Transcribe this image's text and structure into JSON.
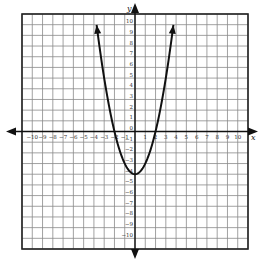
{
  "chart_data": {
    "type": "line",
    "title": "",
    "xlabel": "x",
    "ylabel": "y",
    "xlim": [
      -11,
      11
    ],
    "ylim": [
      -11,
      11
    ],
    "grid": true,
    "x_ticks": [
      -10,
      -9,
      -8,
      -7,
      -6,
      -5,
      -4,
      -3,
      -2,
      -1,
      1,
      2,
      3,
      4,
      5,
      6,
      7,
      8,
      9,
      10
    ],
    "y_ticks": [
      10,
      9,
      8,
      7,
      6,
      5,
      4,
      3,
      2,
      1,
      0,
      -1,
      -2,
      -3,
      -4,
      -5,
      -6,
      -7,
      -8,
      -9,
      -10
    ],
    "series": [
      {
        "name": "y = x^2 - 4",
        "equation": "y = x^2 - 4",
        "vertex": [
          0,
          -4
        ],
        "x_intercepts": [
          -2,
          2
        ],
        "endpoints_with_arrows": [
          [
            -3.74,
            10
          ],
          [
            3.74,
            10
          ]
        ],
        "x": [
          -3.74,
          -3,
          -2,
          -1,
          0,
          1,
          2,
          3,
          3.74
        ],
        "y": [
          10,
          5,
          0,
          -3,
          -4,
          -3,
          0,
          5,
          10
        ]
      }
    ]
  },
  "labels": {
    "x_axis": "x",
    "y_axis": "y"
  }
}
